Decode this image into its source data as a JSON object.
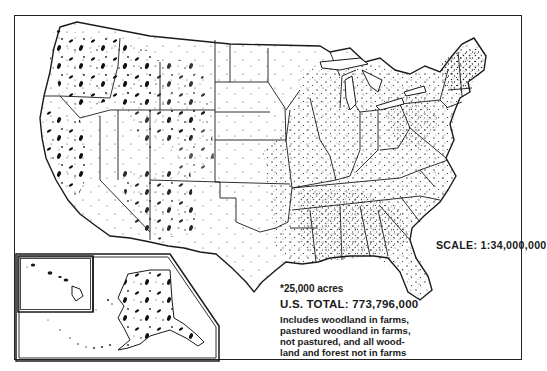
{
  "map": {
    "subject": "Forest and woodland area, United States",
    "dot_legend": "*25,000 acres",
    "total_label": "U.S. TOTAL:",
    "total_value": "773,796,000",
    "total_text": "U.S. TOTAL:  773,796,000",
    "note_lines": [
      "Includes woodland in farms,",
      "pastured woodland in farms,",
      "not pastured, and all wood-",
      "land and forest not in farms"
    ],
    "scale_text": "SCALE:  1:34,000,000",
    "insets": [
      "Hawaii",
      "Alaska"
    ],
    "colors": {
      "ink": "#1a1a1a",
      "background": "#ffffff"
    }
  }
}
